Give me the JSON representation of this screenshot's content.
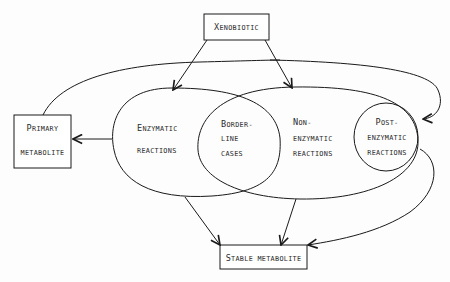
{
  "diagram": {
    "nodes": {
      "xenobiotic": {
        "label_cap": "X",
        "label_rest": "ENOBIOTIC"
      },
      "primary_metabolite": {
        "line1_cap": "P",
        "line1_rest": "RIMARY",
        "line2": "METABOLITE"
      },
      "enzymatic": {
        "line1_cap": "E",
        "line1_rest": "NZYMATIC",
        "line2": "REACTIONS"
      },
      "borderline": {
        "line1_cap": "B",
        "line1_rest": "ORDER-",
        "line2": "LINE",
        "line3": "CASES"
      },
      "non_enzymatic": {
        "line1_cap": "N",
        "line1_rest": "ON-",
        "line2": "ENZYMATIC",
        "line3": "REACTIONS"
      },
      "post_enzymatic": {
        "line1_cap": "P",
        "line1_rest": "OST-",
        "line2": "ENZYMATIC",
        "line3": "REACTIONS"
      },
      "stable_metabolite": {
        "label_cap": "S",
        "label_rest": "TABLE METABOLITE"
      }
    },
    "edges": [
      {
        "from": "Xenobiotic",
        "to": "Enzymatic reactions"
      },
      {
        "from": "Xenobiotic",
        "to": "Non-enzymatic reactions"
      },
      {
        "from": "Xenobiotic",
        "to": "Post-enzymatic reactions"
      },
      {
        "from": "Primary metabolite",
        "to": "Post-enzymatic reactions"
      },
      {
        "from": "Enzymatic reactions",
        "to": "Primary metabolite"
      },
      {
        "from": "Enzymatic reactions",
        "to": "Stable metabolite"
      },
      {
        "from": "Non-enzymatic reactions",
        "to": "Stable metabolite"
      },
      {
        "from": "Post-enzymatic reactions",
        "to": "Stable metabolite"
      }
    ]
  }
}
